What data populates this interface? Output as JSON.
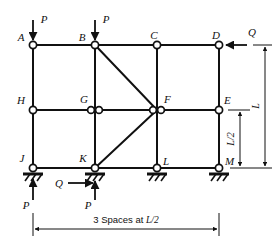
{
  "figure": {
    "type": "structural-frame-diagram",
    "stroke_color": "#111111",
    "background_color": "#ffffff",
    "node_fill_color": "#ffffff"
  },
  "geometry": {
    "columns_x": [
      33,
      95,
      157,
      219
    ],
    "levels_y": {
      "top": 45,
      "middle": 110,
      "base": 168
    }
  },
  "nodes": [
    {
      "id": "A",
      "label": "A",
      "x": 33,
      "y": 45,
      "label_dx": -12,
      "label_dy": -4,
      "double": false
    },
    {
      "id": "B",
      "label": "B",
      "x": 95,
      "y": 45,
      "label_dx": -13,
      "label_dy": -4,
      "double": false
    },
    {
      "id": "C",
      "label": "C",
      "x": 157,
      "y": 45,
      "label_dx": -3,
      "label_dy": -6,
      "double": false
    },
    {
      "id": "D",
      "label": "D",
      "x": 219,
      "y": 45,
      "label_dx": -3,
      "label_dy": -6,
      "double": false
    },
    {
      "id": "H",
      "label": "H",
      "x": 33,
      "y": 110,
      "label_dx": -12,
      "label_dy": -6,
      "double": false
    },
    {
      "id": "G",
      "label": "G",
      "x": 95,
      "y": 110,
      "label_dx": -11,
      "label_dy": -7,
      "double": true
    },
    {
      "id": "F",
      "label": "F",
      "x": 157,
      "y": 110,
      "label_dx": 5,
      "label_dy": -7,
      "double": true
    },
    {
      "id": "E",
      "label": "E",
      "x": 219,
      "y": 110,
      "label_dx": 5,
      "label_dy": -6,
      "double": false
    },
    {
      "id": "J",
      "label": "J",
      "x": 33,
      "y": 168,
      "label_dx": -11,
      "label_dy": -6,
      "double": false
    },
    {
      "id": "K",
      "label": "K",
      "x": 95,
      "y": 168,
      "label_dx": -12,
      "label_dy": -6,
      "double": false
    },
    {
      "id": "L",
      "label": "L",
      "x": 157,
      "y": 168,
      "label_dx": 6,
      "label_dy": -3,
      "double": false
    },
    {
      "id": "M",
      "label": "M",
      "x": 219,
      "y": 168,
      "label_dx": 6,
      "label_dy": -3,
      "double": false
    }
  ],
  "members": {
    "top_chord": {
      "from": "A",
      "to": "D"
    },
    "middle_chord": {
      "from": "H",
      "to": "E"
    },
    "base_chord": {
      "from": "J",
      "to": "M"
    },
    "columns": [
      {
        "from": "A",
        "to": "J"
      },
      {
        "from": "B",
        "to": "K"
      },
      {
        "from": "C",
        "to": "L"
      },
      {
        "from": "D",
        "to": "M"
      }
    ],
    "diagonals": [
      {
        "from": "B",
        "to": "F"
      },
      {
        "from": "K",
        "to": "F"
      }
    ]
  },
  "supports": [
    {
      "at": "J",
      "kind": "pinned-hatched"
    },
    {
      "at": "K",
      "kind": "pinned-hatched"
    },
    {
      "at": "L",
      "kind": "pinned-hatched"
    },
    {
      "at": "M",
      "kind": "pinned-hatched"
    }
  ],
  "loads": [
    {
      "id": "P-at-A",
      "label": "P",
      "at": "A",
      "direction": "down",
      "label_x": 44,
      "label_y": 22
    },
    {
      "id": "P-at-B",
      "label": "P",
      "at": "B",
      "direction": "down",
      "label_x": 106,
      "label_y": 22
    },
    {
      "id": "Q-at-D",
      "label": "Q",
      "at": "D",
      "direction": "left",
      "label_x": 251,
      "label_y": 35
    },
    {
      "id": "P-at-J",
      "label": "P",
      "at": "J",
      "direction": "up",
      "label_x": 28,
      "label_y": 206
    },
    {
      "id": "Q-at-K",
      "label": "Q",
      "at": "K",
      "direction": "right",
      "label_x": 59,
      "label_y": 187
    },
    {
      "id": "P-at-K",
      "label": "P",
      "at": "K",
      "direction": "up",
      "label_x": 90,
      "label_y": 206
    }
  ],
  "dimensions": {
    "horizontal": {
      "id": "span-dimension",
      "text_prefix": "3 Spaces at ",
      "text_value": "L/2",
      "from_x": 33,
      "to_x": 219,
      "y": 229,
      "label_x": 126,
      "label_y": 223
    },
    "vertical_inner": {
      "id": "half-height-dimension",
      "label": "L/2",
      "x": 240,
      "from_y": 110,
      "to_y": 168,
      "label_x": 237,
      "label_y": 139
    },
    "vertical_outer": {
      "id": "full-height-dimension",
      "label": "L",
      "x": 265,
      "from_y": 45,
      "to_y": 168,
      "label_x": 262,
      "label_y": 106
    }
  }
}
